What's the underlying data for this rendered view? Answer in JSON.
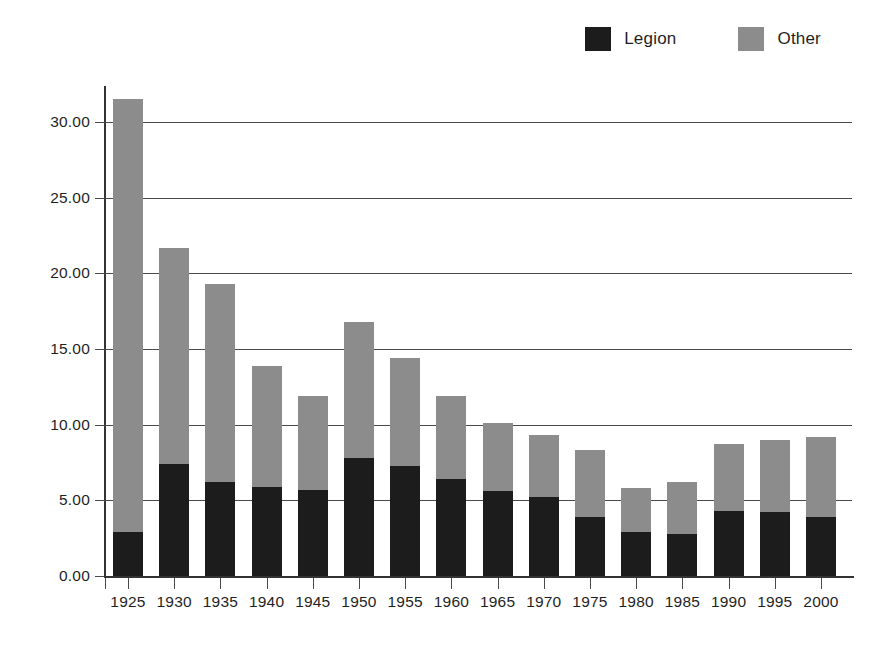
{
  "legend": {
    "position": "top-right",
    "entries": [
      {
        "label": "Legion",
        "color": "#1c1c1c",
        "swatch": "legend-swatch-legion"
      },
      {
        "label": "Other",
        "color": "#8c8c8c",
        "swatch": "legend-swatch-other"
      }
    ]
  },
  "chart_data": {
    "type": "bar",
    "stacked": true,
    "title": "",
    "subtitle": "",
    "xlabel": "",
    "ylabel": "",
    "ylim": [
      0,
      32
    ],
    "grid": true,
    "legend_position": "top-right",
    "ytick_labels": [
      "0.00",
      "5.00",
      "10.00",
      "15.00",
      "20.00",
      "25.00",
      "30.00"
    ],
    "ytick_values": [
      0,
      5,
      10,
      15,
      20,
      25,
      30
    ],
    "categories": [
      "1925",
      "1930",
      "1935",
      "1940",
      "1945",
      "1950",
      "1955",
      "1960",
      "1965",
      "1970",
      "1975",
      "1980",
      "1985",
      "1990",
      "1995",
      "2000"
    ],
    "series": [
      {
        "name": "Legion",
        "color": "#1c1c1c",
        "values": [
          2.9,
          7.4,
          6.2,
          5.9,
          5.7,
          7.8,
          7.3,
          6.4,
          5.6,
          5.2,
          3.9,
          2.9,
          2.8,
          4.3,
          4.2,
          3.9
        ]
      },
      {
        "name": "Other",
        "color": "#8c8c8c",
        "values": [
          28.6,
          14.3,
          13.1,
          8.0,
          6.2,
          9.0,
          7.1,
          5.5,
          4.5,
          4.1,
          4.4,
          2.9,
          3.4,
          4.4,
          4.8,
          5.3
        ]
      }
    ],
    "totals": [
      31.5,
      21.7,
      19.3,
      13.9,
      11.9,
      16.8,
      14.4,
      11.9,
      10.1,
      9.3,
      8.3,
      5.8,
      6.2,
      8.7,
      9.0,
      9.2
    ]
  }
}
